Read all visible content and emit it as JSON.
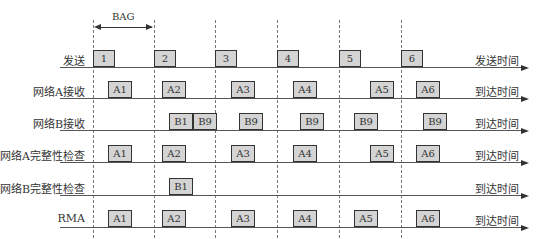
{
  "bag": {
    "label": "BAG"
  },
  "rows": [
    {
      "id": "send",
      "label": "发送",
      "end_label": "发送时间",
      "boxes": [
        {
          "text": "1",
          "x": 93
        },
        {
          "text": "2",
          "x": 154
        },
        {
          "text": "3",
          "x": 215
        },
        {
          "text": "4",
          "x": 277
        },
        {
          "text": "5",
          "x": 339
        },
        {
          "text": "6",
          "x": 401
        }
      ]
    },
    {
      "id": "net-a-recv",
      "label": "网络A接收",
      "end_label": "到达时间",
      "boxes": [
        {
          "text": "A1",
          "x": 108
        },
        {
          "text": "A2",
          "x": 162
        },
        {
          "text": "A3",
          "x": 231
        },
        {
          "text": "A4",
          "x": 293
        },
        {
          "text": "A5",
          "x": 370
        },
        {
          "text": "A6",
          "x": 416
        }
      ]
    },
    {
      "id": "net-b-recv",
      "label": "网络B接收",
      "end_label": "到达时间",
      "boxes": [
        {
          "text": "B1",
          "x": 169
        },
        {
          "text": "B9",
          "x": 193
        },
        {
          "text": "B9",
          "x": 239
        },
        {
          "text": "B9",
          "x": 300
        },
        {
          "text": "B9",
          "x": 354
        },
        {
          "text": "B9",
          "x": 423
        }
      ]
    },
    {
      "id": "net-a-check",
      "label": "网络A完整性检查",
      "end_label": "到达时间",
      "boxes": [
        {
          "text": "A1",
          "x": 108
        },
        {
          "text": "A2",
          "x": 162
        },
        {
          "text": "A3",
          "x": 231
        },
        {
          "text": "A4",
          "x": 293
        },
        {
          "text": "A5",
          "x": 370
        },
        {
          "text": "A6",
          "x": 416
        }
      ]
    },
    {
      "id": "net-b-check",
      "label": "网络B完整性检查",
      "end_label": "到达时间",
      "boxes": [
        {
          "text": "B1",
          "x": 169
        }
      ]
    },
    {
      "id": "rma",
      "label": "RMA",
      "end_label": "到达时间",
      "boxes": [
        {
          "text": "A1",
          "x": 108
        },
        {
          "text": "A2",
          "x": 162
        },
        {
          "text": "A3",
          "x": 231
        },
        {
          "text": "A4",
          "x": 293
        },
        {
          "text": "A5",
          "x": 354
        },
        {
          "text": "A6",
          "x": 416
        }
      ]
    }
  ],
  "colors": {
    "box_fill": "#d4d4d4",
    "box_border": "#333333",
    "line": "#555555"
  }
}
